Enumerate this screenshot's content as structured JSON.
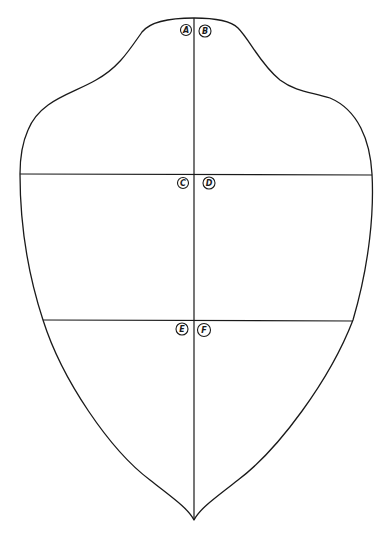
{
  "diagram": {
    "title": "",
    "stroke_color": "#1a1a1a",
    "background_color": "#ffffff",
    "markers": [
      {
        "id": "A",
        "label": "A",
        "position": "top-left of center line"
      },
      {
        "id": "B",
        "label": "B",
        "position": "top-right of center line"
      },
      {
        "id": "C",
        "label": "C",
        "position": "upper horizontal line, left of center"
      },
      {
        "id": "D",
        "label": "D",
        "position": "upper horizontal line, right of center"
      },
      {
        "id": "E",
        "label": "E",
        "position": "lower horizontal line, left of center"
      },
      {
        "id": "F",
        "label": "F",
        "position": "lower horizontal line, right of center"
      }
    ],
    "lines": [
      {
        "id": "center-vertical",
        "label": "vertical center line"
      },
      {
        "id": "upper-horizontal",
        "label": "upper horizontal line"
      },
      {
        "id": "lower-horizontal",
        "label": "lower horizontal line"
      }
    ]
  }
}
